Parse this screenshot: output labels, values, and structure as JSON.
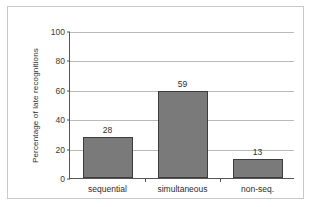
{
  "chart_data": {
    "type": "bar",
    "title": "",
    "subtitle": "",
    "xlabel": "",
    "ylabel": "Percentage of late recognitions",
    "categories": [
      "sequential",
      "simultaneous",
      "non-seq."
    ],
    "values": [
      28,
      59,
      13
    ],
    "data_labels": [
      "28",
      "59",
      "13"
    ],
    "ylim": [
      0,
      100
    ],
    "ytick_labels": [
      "0",
      "20",
      "40",
      "60",
      "80",
      "100"
    ],
    "ytick_values": [
      0,
      20,
      40,
      60,
      80,
      100
    ],
    "grid": "horizontal",
    "legend": "none",
    "bar_color": "#7a7a7a",
    "bar_border_color": "#3d3d3d",
    "gridline_color": "#b9b9b9",
    "axis_color": "#555555",
    "background_color": "#ffffff",
    "frame_color": "#c9c9c9"
  }
}
